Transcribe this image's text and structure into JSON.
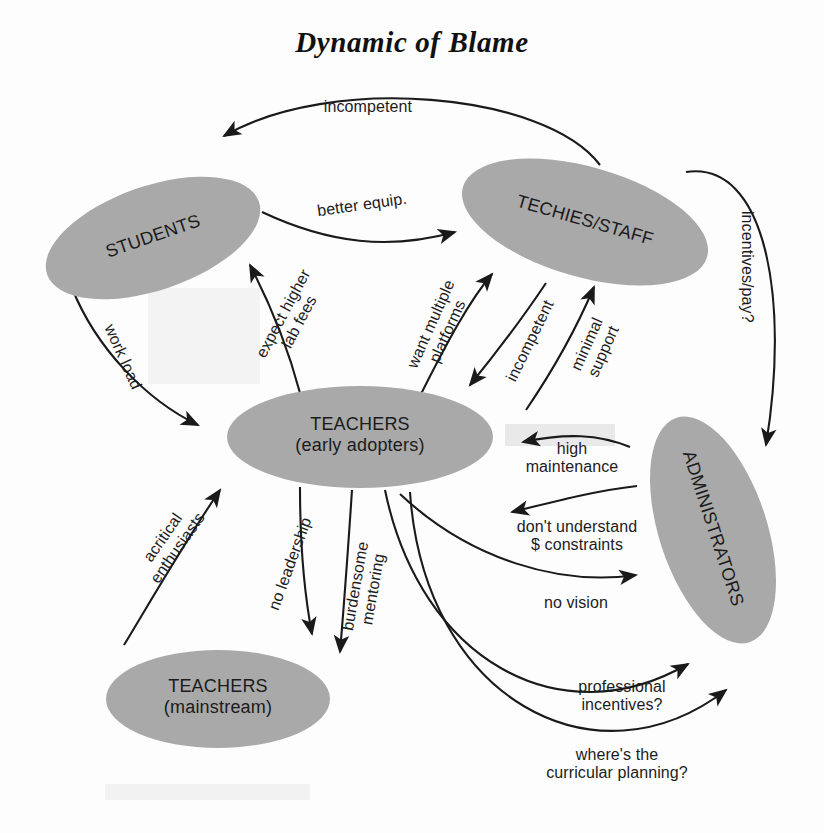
{
  "title": "Dynamic of Blame",
  "style": {
    "node_fill": "#a9a9a9",
    "edge_color": "#1a1a1a",
    "text_color": "#1b1b1b",
    "background": "#fdfdfd"
  },
  "diagram": {
    "type": "causal-loop-diagram",
    "nodes": [
      {
        "id": "students",
        "label": "STUDENTS",
        "sublabel": "",
        "cx": 153,
        "cy": 238,
        "rx": 112,
        "ry": 52,
        "rotation": -19
      },
      {
        "id": "techies",
        "label": "TECHIES/STAFF",
        "sublabel": "",
        "cx": 585,
        "cy": 222,
        "rx": 127,
        "ry": 55,
        "rotation": 16
      },
      {
        "id": "teachers_early",
        "label": "TEACHERS",
        "sublabel": "(early adopters)",
        "cx": 360,
        "cy": 437,
        "rx": 133,
        "ry": 51,
        "rotation": 0
      },
      {
        "id": "administrators",
        "label": "ADMINISTRATORS",
        "sublabel": "",
        "cx": 713,
        "cy": 530,
        "rx": 118,
        "ry": 54,
        "rotation": 72
      },
      {
        "id": "teachers_main",
        "label": "TEACHERS",
        "sublabel": "(mainstream)",
        "cx": 218,
        "cy": 699,
        "rx": 112,
        "ry": 49,
        "rotation": 0
      }
    ],
    "edges": [
      {
        "id": "e1",
        "from": "techies",
        "to": "students",
        "label": "incompetent",
        "rotation": 0
      },
      {
        "id": "e2",
        "from": "students",
        "to": "techies",
        "label": "better equip.",
        "rotation": -8
      },
      {
        "id": "e3",
        "from": "techies",
        "to": "administrators",
        "label": "incentives/pay?",
        "rotation": 90
      },
      {
        "id": "e4",
        "from": "teachers_early",
        "to": "students",
        "label": "expect higher\nlab fees",
        "rotation": -62
      },
      {
        "id": "e5",
        "from": "students",
        "to": "teachers_early",
        "label": "work load",
        "rotation": 66
      },
      {
        "id": "e6",
        "from": "teachers_early",
        "to": "techies",
        "label": "want multiple\nplatforms",
        "rotation": -66
      },
      {
        "id": "e7",
        "from": "techies",
        "to": "teachers_early",
        "label": "incompetent",
        "rotation": -64
      },
      {
        "id": "e8",
        "from": "teachers_early",
        "to": "techies",
        "label": "minimal\nsupport",
        "rotation": -66
      },
      {
        "id": "e9",
        "from": "administrators",
        "to": "teachers_early",
        "label": "high\nmaintenance",
        "rotation": 0
      },
      {
        "id": "e10",
        "from": "administrators",
        "to": "teachers_early",
        "label": "don't understand\n$ constraints",
        "rotation": 0
      },
      {
        "id": "e11",
        "from": "teachers_early",
        "to": "administrators",
        "label": "no vision",
        "rotation": 0
      },
      {
        "id": "e12",
        "from": "teachers_main",
        "to": "teachers_early",
        "label": "acritical\nenthusiasts",
        "rotation": -55
      },
      {
        "id": "e13",
        "from": "teachers_early",
        "to": "teachers_main",
        "label": "no leadership",
        "rotation": -70
      },
      {
        "id": "e14",
        "from": "teachers_early",
        "to": "teachers_main",
        "label": "burdensome\nmentoring",
        "rotation": -80
      },
      {
        "id": "e15",
        "from": "teachers_early",
        "to": "administrators",
        "label": "professional\nincentives?",
        "rotation": 0
      },
      {
        "id": "e16",
        "from": "teachers_early",
        "to": "administrators",
        "label": "where's the\ncurricular planning?",
        "rotation": 0
      }
    ]
  }
}
